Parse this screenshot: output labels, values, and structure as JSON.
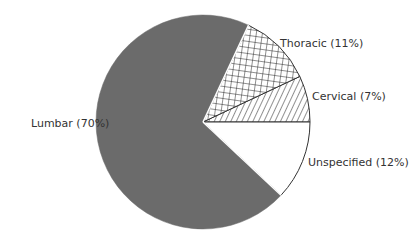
{
  "chart_data": {
    "type": "pie",
    "title": "",
    "categories": [
      "Lumbar",
      "Thoracic",
      "Cervical",
      "Unspecified"
    ],
    "values": [
      70,
      11,
      7,
      12
    ],
    "unit": "%",
    "labels": [
      "Lumbar (70%)",
      "Thoracic (11%)",
      "Cervical (7%)",
      "Unspecified (12%)"
    ],
    "fills": {
      "Lumbar": "solid grey #6b6b6b",
      "Thoracic": "crosshatch grid",
      "Cervical": "diagonal hatch",
      "Unspecified": "white"
    },
    "legend": "none (direct labels)",
    "start_angle_note": "Cervical/Unspecified boundary at 3 o'clock; slices ordered counter-clockwise Cervical, Thoracic, Lumbar, then Unspecified"
  },
  "labels": {
    "lumbar": "Lumbar (70%)",
    "thoracic": "Thoracic (11%)",
    "cervical": "Cervical (7%)",
    "unspecified": "Unspecified (12%)"
  },
  "colors": {
    "lumbar_fill": "#6b6b6b",
    "outline": "#333333",
    "text": "#333333"
  }
}
